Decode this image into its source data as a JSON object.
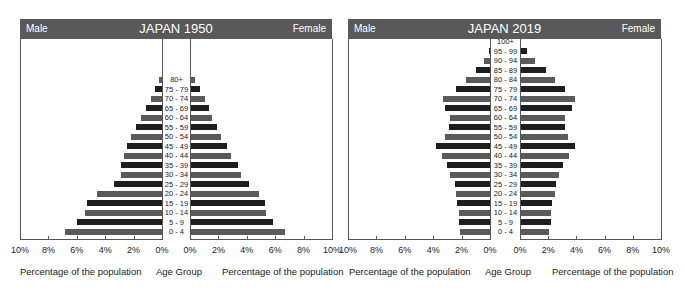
{
  "chart_data": [
    {
      "type": "bar",
      "subtype": "population-pyramid",
      "title": "JAPAN 1950",
      "left_label": "Male",
      "right_label": "Female",
      "xlabel_left": "Percentage of the population",
      "xlabel_center": "Age Group",
      "xlabel_right": "Percentage of the population",
      "xlim": [
        0,
        10
      ],
      "x_ticks": [
        "10%",
        "8%",
        "6%",
        "4%",
        "2%",
        "0%"
      ],
      "x_ticks_right": [
        "0%",
        "2%",
        "4%",
        "6%",
        "8%",
        "10%"
      ],
      "categories": [
        "80+",
        "75 - 79",
        "70 - 74",
        "65 - 69",
        "60 - 64",
        "55 - 59",
        "50 - 54",
        "45 - 49",
        "40 - 44",
        "35 - 39",
        "30 - 34",
        "25 - 29",
        "20 - 24",
        "15 - 19",
        "10 - 14",
        "5 - 9",
        "0 - 4"
      ],
      "series": [
        {
          "name": "Male",
          "values": [
            0.2,
            0.5,
            0.8,
            1.1,
            1.5,
            1.8,
            2.2,
            2.5,
            2.7,
            2.9,
            2.9,
            3.4,
            4.6,
            5.3,
            5.4,
            6.0,
            6.8
          ]
        },
        {
          "name": "Female",
          "values": [
            0.3,
            0.6,
            1.0,
            1.3,
            1.5,
            1.8,
            2.1,
            2.5,
            2.8,
            3.3,
            3.5,
            4.1,
            4.8,
            5.2,
            5.3,
            5.8,
            6.6
          ]
        }
      ]
    },
    {
      "type": "bar",
      "subtype": "population-pyramid",
      "title": "JAPAN 2019",
      "left_label": "Male",
      "right_label": "Female",
      "xlabel_left": "Percentage of the population",
      "xlabel_center": "Age Group",
      "xlabel_right": "Percentage of the population",
      "xlim": [
        0,
        10
      ],
      "x_ticks": [
        "10%",
        "8%",
        "6%",
        "4%",
        "2%",
        "0%"
      ],
      "x_ticks_right": [
        "0%",
        "2%",
        "4%",
        "6%",
        "8%",
        "10%"
      ],
      "categories": [
        "100+",
        "95 - 99",
        "90 - 94",
        "85 - 89",
        "80 - 84",
        "75 - 79",
        "70 - 74",
        "65 - 69",
        "60 - 64",
        "55 - 59",
        "50 - 54",
        "45 - 49",
        "40 - 44",
        "35 - 39",
        "30 - 34",
        "25 - 29",
        "20 - 24",
        "15 - 19",
        "10 - 14",
        "5 - 9",
        "0 - 4"
      ],
      "series": [
        {
          "name": "Male",
          "values": [
            0.0,
            0.1,
            0.4,
            1.0,
            1.7,
            2.4,
            3.3,
            3.2,
            2.8,
            2.9,
            3.2,
            3.8,
            3.4,
            3.0,
            2.8,
            2.5,
            2.4,
            2.3,
            2.2,
            2.2,
            2.1
          ]
        },
        {
          "name": "Female",
          "values": [
            0.0,
            0.4,
            1.0,
            1.8,
            2.4,
            3.1,
            3.8,
            3.6,
            3.1,
            3.1,
            3.3,
            3.8,
            3.4,
            3.0,
            2.7,
            2.5,
            2.4,
            2.2,
            2.1,
            2.1,
            2.0
          ]
        }
      ]
    }
  ],
  "panels": [
    {
      "title": "JAPAN 1950",
      "male": "Male",
      "female": "Female",
      "xlabel_left": "Percentage of the population",
      "xlabel_center": "Age Group",
      "xlabel_right": "Percentage of the population"
    },
    {
      "title": "JAPAN 2019",
      "male": "Male",
      "female": "Female",
      "xlabel_left": "Percentage of the population",
      "xlabel_center": "Age Group",
      "xlabel_right": "Percentage of the population"
    }
  ],
  "colors": {
    "header": "#595959",
    "bar_dark": "#1e1e1e",
    "bar_light": "#5a5a5a",
    "axis": "#555555"
  }
}
